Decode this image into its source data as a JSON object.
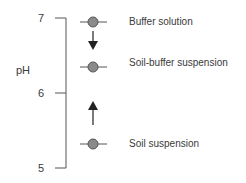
{
  "axis": {
    "label": "pH",
    "ticks": [
      {
        "value": "7",
        "y": 18
      },
      {
        "value": "6",
        "y": 93
      },
      {
        "value": "5",
        "y": 168
      }
    ],
    "color": "#555555"
  },
  "points": [
    {
      "label": "Buffer solution",
      "ph": 6.94,
      "y": 22
    },
    {
      "label": "Soil-buffer suspension",
      "ph": 6.35,
      "y": 67
    },
    {
      "label": "Soil suspension",
      "ph": 5.33,
      "y": 144
    }
  ],
  "arrows": [
    {
      "direction": "down",
      "from": "Buffer solution",
      "to": "Soil-buffer suspension"
    },
    {
      "direction": "up",
      "from": "Soil suspension",
      "to": "Soil-buffer suspension"
    }
  ],
  "colors": {
    "marker_fill": "#8a8a8a",
    "marker_stroke": "#555555",
    "line": "#555555",
    "arrow": "#222222"
  }
}
